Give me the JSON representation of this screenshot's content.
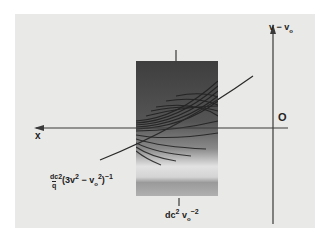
{
  "figure": {
    "background_color": "#e9e9e7",
    "axis_color": "#3a3a3a",
    "labels": {
      "x_axis": "x",
      "y_axis": "v − v",
      "y_axis_sub": "o",
      "origin": "O",
      "curve_label": "dc",
      "curve_label_sup": "2",
      "curve_label_mid": "(3v",
      "curve_label_sup2": "2",
      "curve_label_mid2": " − v",
      "curve_label_sub": "o",
      "curve_label_sup3": "2",
      "curve_label_end": ")",
      "curve_label_exp": "−1",
      "curve_label_denom": "q",
      "tick_label_prefix": "dc",
      "tick_label_sup": "2",
      "tick_label_v": " v",
      "tick_label_sub": "o",
      "tick_label_exp": "−2"
    },
    "fringe_image": {
      "description": "interference fringe pattern",
      "dark_color": "#3b3b3b",
      "light_color": "#d8d8d8"
    }
  }
}
